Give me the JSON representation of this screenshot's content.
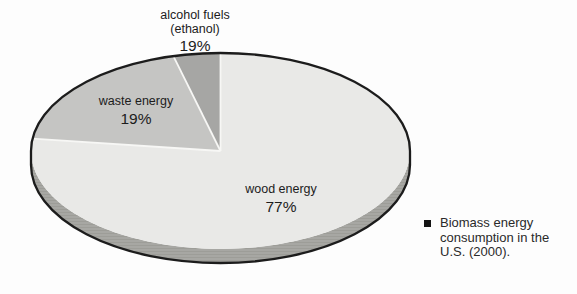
{
  "page": {
    "background": "#fdfdfd"
  },
  "chart_data": {
    "type": "pie",
    "style": "3d-ellipse-pie",
    "title": "Biomass energy consumption in the U.S. (2000)",
    "unit": "%",
    "start_angle_deg": 90,
    "direction": "counterclockwise",
    "slices": [
      {
        "id": "alcohol-fuels",
        "label_line1": "alcohol fuels",
        "label_line2": "(ethanol)",
        "percent_label": "19%",
        "value_labeled": 19,
        "drawn_percent": 4,
        "color": "#a6a6a4"
      },
      {
        "id": "waste-energy",
        "label_line1": "waste energy",
        "label_line2": "",
        "percent_label": "19%",
        "value_labeled": 19,
        "drawn_percent": 19,
        "color": "#c5c5c3"
      },
      {
        "id": "wood-energy",
        "label_line1": "wood energy",
        "label_line2": "",
        "percent_label": "77%",
        "value_labeled": 77,
        "drawn_percent": 77,
        "color": "#e9e9e7"
      }
    ],
    "rim": {
      "color": "#a7a7a3",
      "line_color": "#95958f",
      "depth_px": 14
    },
    "outline_color": "#1c1c1c",
    "separator_color": "#f7f7f5",
    "legend_position": "bottom-right"
  },
  "caption": {
    "bullet_icon": "black-square",
    "line1": "Biomass energy",
    "line2": "consumption in the",
    "line3": "U.S. (2000)."
  }
}
